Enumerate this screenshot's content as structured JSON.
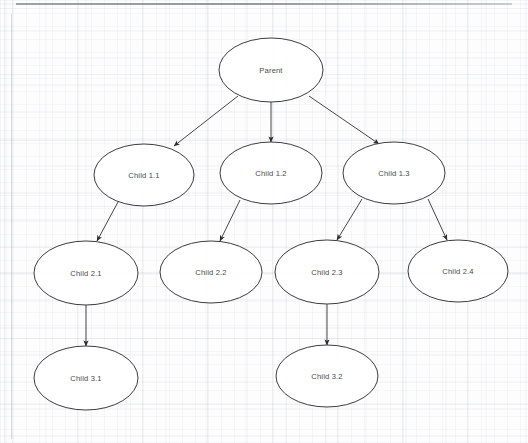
{
  "diagram": {
    "type": "tree",
    "background": "#fdfdfd",
    "grid_color": "#aab0c0",
    "node_stroke": "#3c3c40",
    "node_fill": "#ffffff",
    "edge_color": "#46464a",
    "label_color": "#4a4a4e",
    "nodes": [
      {
        "id": "parent",
        "label": "Parent",
        "cx": 271,
        "cy": 70,
        "rx": 52,
        "ry": 32
      },
      {
        "id": "child1_1",
        "label": "Child 1.1",
        "cx": 144,
        "cy": 175,
        "rx": 50,
        "ry": 31
      },
      {
        "id": "child1_2",
        "label": "Child 1.2",
        "cx": 271,
        "cy": 173,
        "rx": 51,
        "ry": 31
      },
      {
        "id": "child1_3",
        "label": "Child 1.3",
        "cx": 394,
        "cy": 173,
        "rx": 51,
        "ry": 31
      },
      {
        "id": "child2_1",
        "label": "Child 2.1",
        "cx": 86,
        "cy": 273,
        "rx": 52,
        "ry": 32
      },
      {
        "id": "child2_2",
        "label": "Child 2.2",
        "cx": 211,
        "cy": 272,
        "rx": 51,
        "ry": 31
      },
      {
        "id": "child2_3",
        "label": "Child 2.3",
        "cx": 327,
        "cy": 272,
        "rx": 52,
        "ry": 32
      },
      {
        "id": "child2_4",
        "label": "Child 2.4",
        "cx": 458,
        "cy": 271,
        "rx": 50,
        "ry": 31
      },
      {
        "id": "child3_1",
        "label": "Child 3.1",
        "cx": 86,
        "cy": 378,
        "rx": 52,
        "ry": 32
      },
      {
        "id": "child3_2",
        "label": "Child 3.2",
        "cx": 327,
        "cy": 376,
        "rx": 51,
        "ry": 31
      }
    ],
    "edges": [
      {
        "id": "e1",
        "from": "parent",
        "to": "child1_1",
        "x1": 238,
        "y1": 96,
        "x2": 174,
        "y2": 146
      },
      {
        "id": "e2",
        "from": "parent",
        "to": "child1_2",
        "x1": 271,
        "y1": 102,
        "x2": 271,
        "y2": 142
      },
      {
        "id": "e3",
        "from": "parent",
        "to": "child1_3",
        "x1": 309,
        "y1": 96,
        "x2": 379,
        "y2": 144
      },
      {
        "id": "e4",
        "from": "child1_1",
        "to": "child2_1",
        "x1": 118,
        "y1": 202,
        "x2": 97,
        "y2": 241
      },
      {
        "id": "e5",
        "from": "child1_2",
        "to": "child2_2",
        "x1": 240,
        "y1": 200,
        "x2": 220,
        "y2": 241
      },
      {
        "id": "e6",
        "from": "child1_3",
        "to": "child2_3",
        "x1": 362,
        "y1": 199,
        "x2": 337,
        "y2": 240
      },
      {
        "id": "e7",
        "from": "child1_3",
        "to": "child2_4",
        "x1": 428,
        "y1": 199,
        "x2": 447,
        "y2": 240
      },
      {
        "id": "e8",
        "from": "child2_1",
        "to": "child3_1",
        "x1": 86,
        "y1": 305,
        "x2": 86,
        "y2": 346
      },
      {
        "id": "e9",
        "from": "child2_3",
        "to": "child3_2",
        "x1": 327,
        "y1": 304,
        "x2": 327,
        "y2": 345
      }
    ]
  }
}
